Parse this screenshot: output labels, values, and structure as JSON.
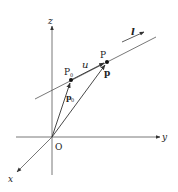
{
  "diagram": {
    "colors": {
      "line": "#333333",
      "background": "#ffffff"
    },
    "axes": {
      "origin_label": "O",
      "x_label": "x",
      "y_label": "y",
      "z_label": "z"
    },
    "points": {
      "P_label": "P",
      "P0_label": "P",
      "P0_subscript": "0"
    },
    "vectors": {
      "p_label": "p",
      "p0_label": "p",
      "p0_subscript": "0",
      "u_label": "u"
    },
    "line": {
      "label": "l"
    }
  }
}
